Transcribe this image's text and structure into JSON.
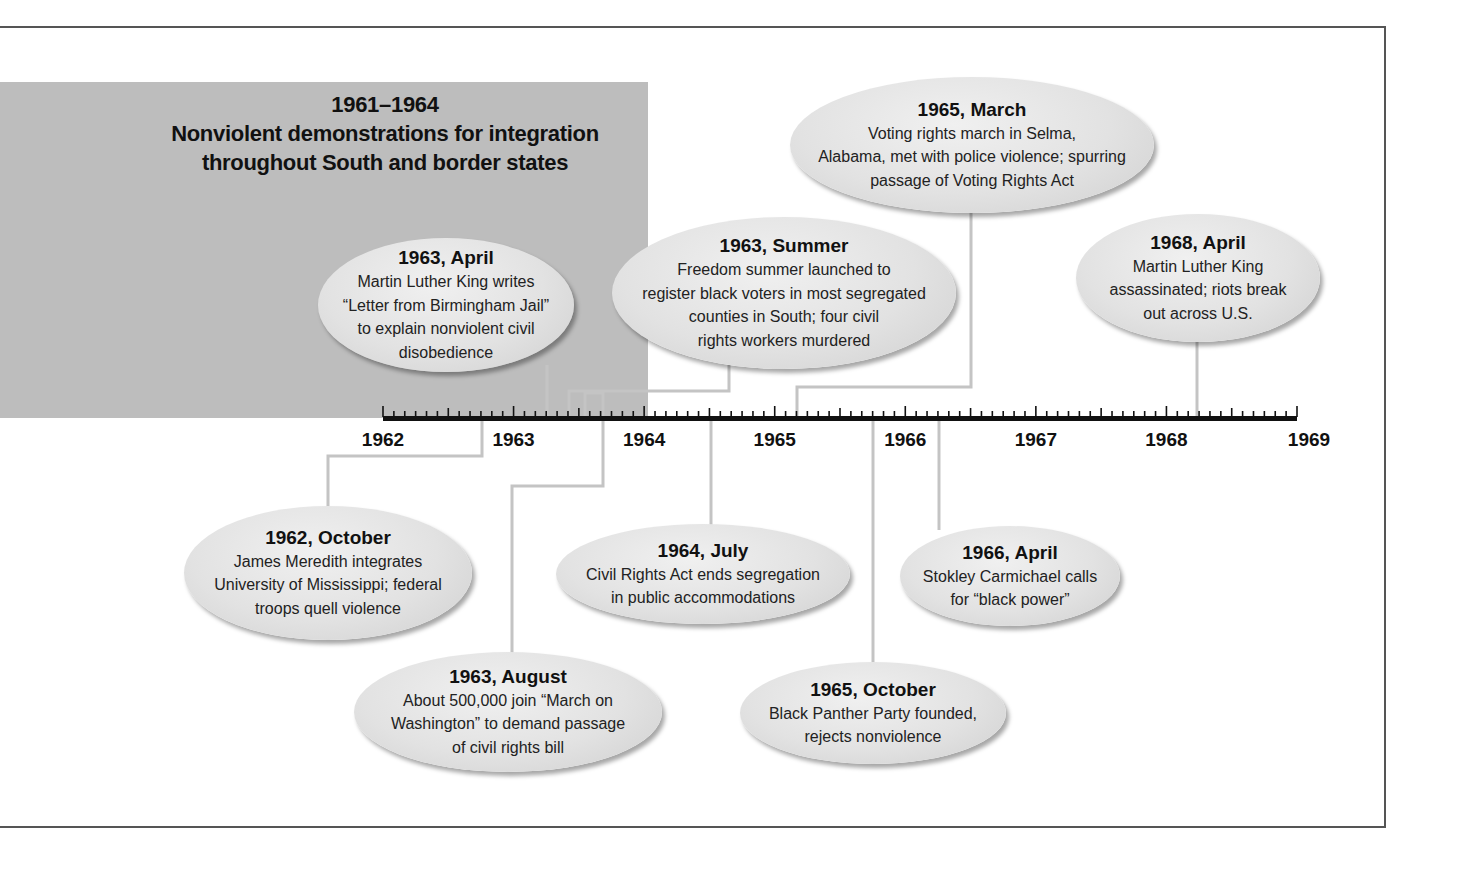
{
  "period": {
    "range": "1961–1964",
    "title_line1": "Nonviolent demonstrations for integration",
    "title_line2": "throughout South and border states",
    "color": "#bdbdbd"
  },
  "axis": {
    "years": [
      "1962",
      "1963",
      "1964",
      "1965",
      "1966",
      "1967",
      "1968",
      "1969"
    ],
    "ticks_per_year": 12
  },
  "events": [
    {
      "date": "1962, October",
      "lines": [
        "James Meredith integrates",
        "University of Mississippi; federal",
        "troops quell violence"
      ],
      "position": "below"
    },
    {
      "date": "1963, April",
      "lines": [
        "Martin Luther King writes",
        "“Letter from Birmingham Jail”",
        "to explain nonviolent civil",
        "disobedience"
      ],
      "position": "above"
    },
    {
      "date": "1963, Summer",
      "lines": [
        "Freedom summer launched to",
        "register black voters in most segregated",
        "counties in South; four civil",
        "rights workers murdered"
      ],
      "position": "above"
    },
    {
      "date": "1963, August",
      "lines": [
        "About 500,000 join “March on",
        "Washington” to demand passage",
        "of civil rights bill"
      ],
      "position": "below"
    },
    {
      "date": "1964, July",
      "lines": [
        "Civil Rights Act ends segregation",
        "in public accommodations"
      ],
      "position": "below"
    },
    {
      "date": "1965, March",
      "lines": [
        "Voting rights march in Selma,",
        "Alabama, met with police violence; spurring",
        "passage of Voting Rights Act"
      ],
      "position": "above"
    },
    {
      "date": "1965, October",
      "lines": [
        "Black Panther Party founded,",
        "rejects nonviolence"
      ],
      "position": "below"
    },
    {
      "date": "1966, April",
      "lines": [
        "Stokley Carmichael calls",
        "for “black power”"
      ],
      "position": "below"
    },
    {
      "date": "1968, April",
      "lines": [
        "Martin Luther King",
        "assassinated; riots break",
        "out across U.S."
      ],
      "position": "above"
    }
  ]
}
